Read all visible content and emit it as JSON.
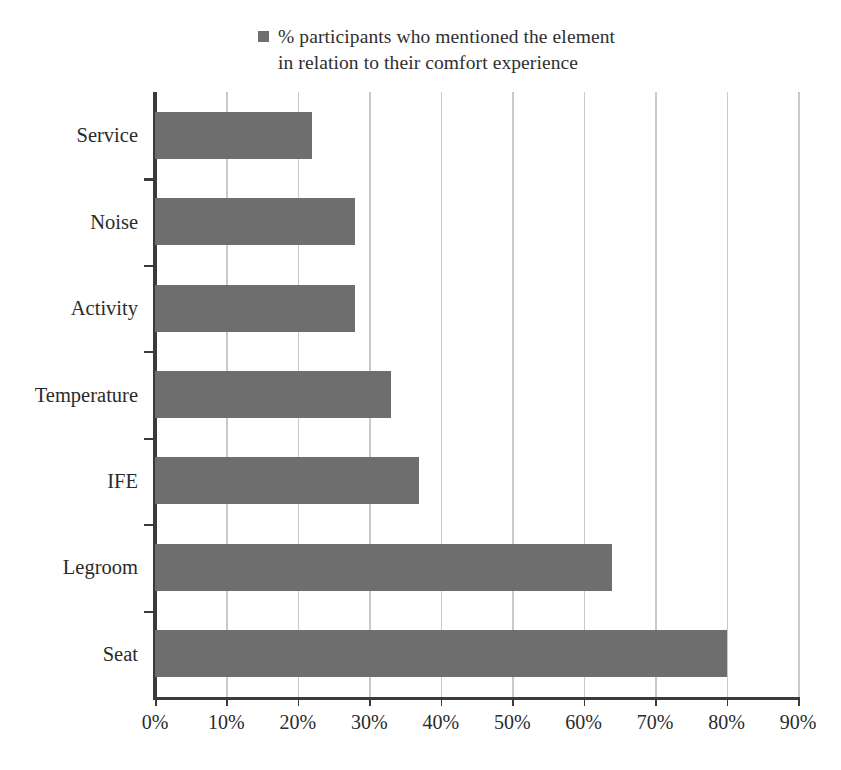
{
  "legend": {
    "swatch_color": "#6e6e6e",
    "label": "% participants who mentioned the element\nin relation to their comfort experience"
  },
  "axis": {
    "x_ticks": [
      "0%",
      "10%",
      "20%",
      "30%",
      "40%",
      "50%",
      "60%",
      "70%",
      "80%",
      "90%"
    ],
    "y_categories": [
      "Service",
      "Noise",
      "Activity",
      "Temperature",
      "IFE",
      "Legroom",
      "Seat"
    ]
  },
  "chart_data": {
    "type": "bar",
    "orientation": "horizontal",
    "title": "",
    "subtitle": "",
    "xlabel": "",
    "ylabel": "",
    "categories": [
      "Service",
      "Noise",
      "Activity",
      "Temperature",
      "IFE",
      "Legroom",
      "Seat"
    ],
    "values": [
      22,
      28,
      28,
      33,
      37,
      64,
      80
    ],
    "value_unit": "%",
    "series": [
      {
        "name": "% participants who mentioned the element in relation to their comfort experience",
        "color": "#6e6e6e",
        "values": [
          22,
          28,
          28,
          33,
          37,
          64,
          80
        ]
      }
    ],
    "xlim": [
      0,
      90
    ],
    "x_tick_values": [
      0,
      10,
      20,
      30,
      40,
      50,
      60,
      70,
      80,
      90
    ],
    "x_tick_labels": [
      "0%",
      "10%",
      "20%",
      "30%",
      "40%",
      "50%",
      "60%",
      "70%",
      "80%",
      "90%"
    ],
    "grid": "vertical",
    "legend_position": "top-center",
    "bar_color": "#6e6e6e",
    "gridline_color": "#c9c9c9",
    "axis_color": "#3a3a3a",
    "background": "#ffffff"
  }
}
